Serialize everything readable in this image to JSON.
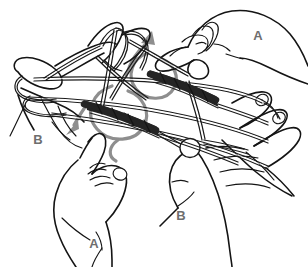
{
  "illustration": {
    "title": "String figure hand manipulation diagram",
    "background_color": "#ffffff",
    "ink_color": "#141414",
    "accent_color": "#8e8e8e",
    "label_color": "#6e6e6e",
    "width": 308,
    "height": 267
  },
  "labels": [
    {
      "id": "label-a-top-right",
      "text": "A",
      "x": 258,
      "y": 40,
      "hand": "top-right-hand"
    },
    {
      "id": "label-b-left",
      "text": "B",
      "x": 38,
      "y": 144,
      "hand": "left-hand"
    },
    {
      "id": "label-a-bottom-left",
      "text": "A",
      "x": 94,
      "y": 248,
      "hand": "bottom-left-hand"
    },
    {
      "id": "label-b-bottom-right",
      "text": "B",
      "x": 181,
      "y": 220,
      "hand": "bottom-right-hand"
    }
  ],
  "hands": [
    {
      "id": "top-right-hand",
      "label": "A",
      "position": "top-right",
      "gesture": "pinching-thumb-and-index"
    },
    {
      "id": "left-hand",
      "label": "B",
      "position": "left",
      "gesture": "thumb-and-fingers-holding-loops"
    },
    {
      "id": "bottom-left-hand",
      "label": "A",
      "position": "bottom-left",
      "gesture": "pinching-thumb-and-index"
    },
    {
      "id": "bottom-right-hand",
      "label": "B",
      "position": "bottom-right",
      "gesture": "open-fingers-holding-loops"
    }
  ],
  "motion_arrows": [
    {
      "id": "arrow-up-right",
      "direction": "up-right",
      "color": "#8e8e8e"
    },
    {
      "id": "arrow-down-left",
      "direction": "down-left",
      "color": "#8e8e8e"
    },
    {
      "id": "arrow-loop-upper",
      "direction": "counter-clockwise-loop",
      "color": "#8e8e8e"
    },
    {
      "id": "arrow-loop-lower",
      "direction": "counter-clockwise-loop",
      "color": "#8e8e8e"
    }
  ],
  "string_figure": {
    "name": "cat's-cradle-string-figure",
    "crossing_count": 2,
    "description": "Looped string stretched between four hands with two dark twisted crossings in the center"
  }
}
